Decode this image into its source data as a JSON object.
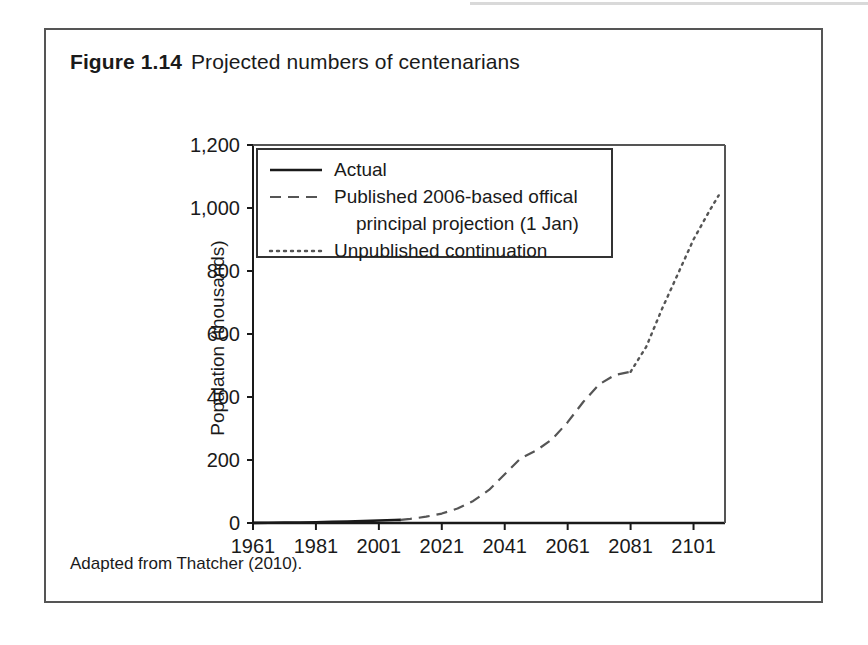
{
  "figure": {
    "number": "Figure 1.14",
    "caption": "Projected numbers of centenarians",
    "source_note": "Adapted from Thatcher (2010)."
  },
  "chart_data": {
    "type": "line",
    "title": "Projected numbers of centenarians",
    "xlabel": "Year",
    "ylabel": "Population (thousands)",
    "xlim": [
      1961,
      2111
    ],
    "ylim": [
      0,
      1200
    ],
    "xticks": [
      1961,
      1981,
      2001,
      2021,
      2041,
      2061,
      2081,
      2101
    ],
    "yticks": [
      0,
      200,
      400,
      600,
      800,
      1000,
      1200
    ],
    "ytick_labels": [
      "0",
      "200",
      "400",
      "600",
      "800",
      "1,000",
      "1,200"
    ],
    "xtick_labels": [
      "1961",
      "1981",
      "2001",
      "2021",
      "2041",
      "2061",
      "2081",
      "2101"
    ],
    "grid": false,
    "legend_position": "upper left",
    "series": [
      {
        "name": "Actual",
        "style": "solid",
        "color": "#1a1a1a",
        "x": [
          1961,
          1966,
          1971,
          1976,
          1981,
          1986,
          1991,
          1996,
          2001,
          2006,
          2008
        ],
        "values": [
          0.3,
          0.6,
          1.2,
          1.8,
          2.6,
          3.5,
          4.7,
          6.0,
          7.8,
          9.3,
          10.0
        ]
      },
      {
        "name": "Published 2006-based offical principal projection (1 Jan)",
        "style": "dashed",
        "color": "#555555",
        "x": [
          2008,
          2011,
          2016,
          2021,
          2026,
          2031,
          2036,
          2041,
          2046,
          2051,
          2056,
          2061,
          2066,
          2071,
          2076,
          2081
        ],
        "values": [
          10,
          13,
          20,
          30,
          46,
          70,
          105,
          155,
          205,
          230,
          265,
          320,
          385,
          440,
          470,
          480
        ]
      },
      {
        "name": "Unpublished continuation",
        "style": "dotted",
        "color": "#555555",
        "x": [
          2081,
          2086,
          2091,
          2096,
          2101,
          2106,
          2109
        ],
        "values": [
          480,
          560,
          680,
          790,
          900,
          990,
          1040
        ]
      }
    ],
    "legend": [
      {
        "label": "Actual",
        "style": "solid"
      },
      {
        "label": "Published 2006-based offical",
        "style": "dashed"
      },
      {
        "label": "principal projection (1 Jan)",
        "style": "none"
      },
      {
        "label": "Unpublished continuation",
        "style": "dotted"
      }
    ]
  }
}
